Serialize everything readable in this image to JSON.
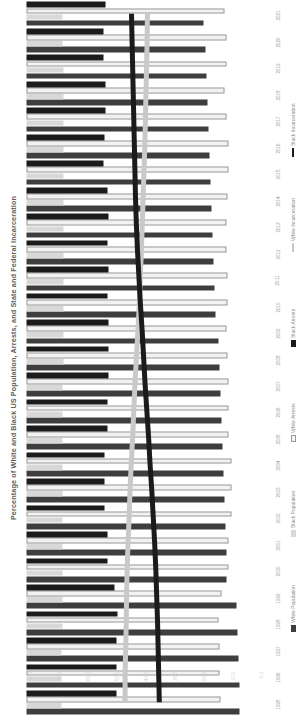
{
  "chart_data": {
    "type": "bar",
    "title": "Percentage of White and Black US Population, Arrests, and State and Federal Incarceration",
    "orientation": "vertical-bars-rotated",
    "xlabel": "",
    "ylabel": "",
    "ylim": [
      0,
      80
    ],
    "grid": false,
    "legend_position": "right",
    "value_ticks": [
      "80.0",
      "70.0",
      "60.0",
      "50.0",
      "40.0",
      "30.0",
      "20.0",
      "10.0",
      "0.0"
    ],
    "categories": [
      "1995",
      "1996",
      "1997",
      "1998",
      "1999",
      "2000",
      "2001",
      "2002",
      "2003",
      "2004",
      "2005",
      "2006",
      "2007",
      "2008",
      "2009",
      "2010",
      "2011",
      "2012",
      "2013",
      "2014",
      "2015",
      "2016",
      "2017",
      "2018",
      "2019",
      "2020",
      "2021"
    ],
    "series": [
      {
        "name": "White Population",
        "kind": "bar",
        "color": "#3e3e3e",
        "values": [
          73.6,
          73.3,
          73.0,
          72.7,
          72.4,
          69.1,
          68.8,
          68.5,
          68.2,
          67.9,
          67.5,
          67.1,
          66.8,
          66.4,
          66.1,
          65.1,
          64.8,
          64.5,
          64.1,
          63.8,
          63.5,
          63.1,
          62.8,
          62.4,
          62.0,
          61.6,
          61.2
        ]
      },
      {
        "name": "Black Population",
        "kind": "bar",
        "color": "#d8d8d8",
        "values": [
          12.1,
          12.2,
          12.2,
          12.3,
          12.3,
          12.3,
          12.3,
          12.4,
          12.4,
          12.4,
          12.4,
          12.5,
          12.5,
          12.6,
          12.6,
          12.6,
          12.6,
          12.7,
          12.7,
          12.7,
          12.7,
          12.7,
          12.7,
          12.8,
          12.8,
          12.4,
          12.4
        ]
      },
      {
        "name": "White Arrests",
        "kind": "bar",
        "color": "#f2f2f2",
        "values": [
          66.8,
          66.6,
          66.5,
          66.3,
          67.4,
          69.7,
          69.5,
          70.7,
          70.6,
          70.8,
          69.8,
          69.7,
          69.7,
          69.2,
          69.1,
          69.4,
          69.2,
          68.9,
          68.9,
          69.4,
          69.7,
          69.6,
          68.9,
          68.2,
          68.9,
          68.8,
          68.2
        ]
      },
      {
        "name": "Black Arrests",
        "kind": "bar",
        "color": "#1b1b1b",
        "values": [
          31.0,
          31.1,
          31.2,
          31.3,
          30.2,
          27.9,
          28.1,
          26.9,
          27.0,
          26.8,
          27.8,
          28.0,
          28.2,
          28.3,
          28.3,
          28.0,
          28.4,
          28.1,
          28.3,
          27.8,
          26.6,
          26.9,
          27.4,
          27.4,
          26.6,
          26.6,
          27.2
        ]
      },
      {
        "name": "White Incarceration",
        "kind": "line",
        "color": "#c9c9c9",
        "values": [
          34.0,
          34.0,
          34.2,
          34.4,
          34.5,
          34.7,
          35.0,
          35.4,
          35.7,
          36.1,
          36.6,
          37.0,
          37.4,
          37.9,
          38.4,
          38.9,
          39.2,
          39.6,
          39.9,
          40.2,
          40.5,
          40.8,
          41.0,
          41.2,
          41.4,
          41.6,
          41.7
        ]
      },
      {
        "name": "Black Incarceration",
        "kind": "line",
        "color": "#1b1b1b",
        "values": [
          45.8,
          45.6,
          45.4,
          45.2,
          44.9,
          44.6,
          44.2,
          43.7,
          43.2,
          42.6,
          42.1,
          41.5,
          40.9,
          40.4,
          39.9,
          39.3,
          38.8,
          38.3,
          37.9,
          37.6,
          37.4,
          37.2,
          37.0,
          36.8,
          36.6,
          36.4,
          36.2
        ]
      }
    ],
    "legend": [
      {
        "label": "White Population",
        "swatch": "sw-whitepop",
        "type": "box"
      },
      {
        "label": "Black Population",
        "swatch": "sw-blackpop",
        "type": "box"
      },
      {
        "label": "White Arrests",
        "swatch": "sw-whitearr",
        "type": "box"
      },
      {
        "label": "Black Arrests",
        "swatch": "sw-blackarr",
        "type": "box"
      },
      {
        "label": "White Incarceration",
        "swatch": "sw-linegray",
        "type": "line"
      },
      {
        "label": "Black Incarceration",
        "swatch": "sw-lineblack",
        "type": "line"
      }
    ]
  }
}
